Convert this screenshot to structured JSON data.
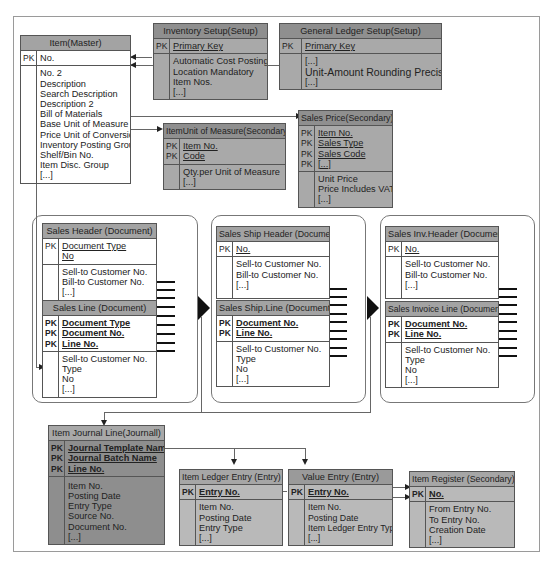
{
  "tables": {
    "item": {
      "title": "Item(Master)",
      "keys": [
        "No."
      ],
      "pk": [
        "PK"
      ],
      "fields": [
        "No. 2",
        "Description",
        "Search Description",
        "Description 2",
        "Bill of Materials",
        "Base Unit of Measure",
        "Price Unit of Conversion",
        "Inventory Posting Group",
        "Shelf/Bin No.",
        "Item Disc. Group",
        "[...]"
      ]
    },
    "inventory_setup": {
      "title": "Inventory Setup(Setup)",
      "keys": [
        "Primary Key"
      ],
      "pk": [
        "PK"
      ],
      "fields": [
        "Automatic Cost Posting",
        "Location Mandatory",
        "Item Nos.",
        "[...]"
      ]
    },
    "gl_setup": {
      "title": "General Ledger Setup(Setup)",
      "keys": [
        "Primary Key"
      ],
      "pk": [
        "PK"
      ],
      "fields": [
        "[...]",
        "Unit-Amount Rounding Precision",
        "[...]"
      ]
    },
    "item_uom": {
      "title": "ItemUnit of Measure(Secondary)",
      "keys": [
        "Item No.",
        "Code"
      ],
      "pk": [
        "PK",
        "PK"
      ],
      "fields": [
        "Qty.per Unit of Measure",
        "[...]"
      ]
    },
    "sales_price": {
      "title": "Sales Price(Secondary)",
      "keys": [
        "Item No.",
        "Sales Type",
        "Sales Code",
        "[...]"
      ],
      "pk": [
        "PK",
        "PK",
        "PK",
        "PK"
      ],
      "fields": [
        "Unit Price",
        "Price Includes VAT",
        "[...]"
      ]
    },
    "sales_header": {
      "title": "Sales Header (Document)",
      "keys": [
        "Document Type",
        "No"
      ],
      "pk": [
        "PK"
      ],
      "fields": [
        "Sell-to Customer No.",
        "Bill-to Customer No.",
        "[...]"
      ]
    },
    "sales_line": {
      "title": "Sales Line (Document)",
      "keys": [
        "Document Type",
        "Document No.",
        "Line No."
      ],
      "pk": [
        "PK",
        "PK",
        "PK"
      ],
      "fields": [
        "Sell-to Customer No.",
        "Type",
        "No",
        "[...]"
      ]
    },
    "sales_ship_header": {
      "title": "Sales Ship Header (Document)",
      "keys": [
        "No."
      ],
      "pk": [
        "PK"
      ],
      "fields": [
        "Sell-to Customer No.",
        "Bill-to Customer No.",
        "[...]"
      ]
    },
    "sales_ship_line": {
      "title": "Sales Ship.Line (Document)",
      "keys": [
        "Document No.",
        "Line No."
      ],
      "pk": [
        "PK",
        "PK"
      ],
      "fields": [
        "Sell-to Customer No.",
        "Type",
        "No",
        "[...]"
      ]
    },
    "sales_inv_header": {
      "title": "Sales Inv.Header (Document)",
      "keys": [
        "No."
      ],
      "pk": [
        "PK"
      ],
      "fields": [
        "Sell-to Customer No.",
        "Bill-to Customer No.",
        "[...]"
      ]
    },
    "sales_inv_line": {
      "title": "Sales Invoice Line (Document)",
      "keys": [
        "Document No.",
        "Line No."
      ],
      "pk": [
        "PK",
        "PK"
      ],
      "fields": [
        "Sell-to Customer No.",
        "Type",
        "No",
        "[...]"
      ]
    },
    "item_journal_line": {
      "title": "Item Journal Line(Journall)",
      "keys": [
        "Journal Template Name",
        "Journal Batch Name",
        "Line No."
      ],
      "pk": [
        "PK",
        "PK",
        "PK"
      ],
      "fields": [
        "Item No.",
        "Posting Date",
        "Entry Type",
        "Source No.",
        "Document No.",
        "[...]"
      ]
    },
    "item_ledger_entry": {
      "title": "Item Ledger Entry (Entry)",
      "keys": [
        "Entry No."
      ],
      "pk": [
        "PK"
      ],
      "fields": [
        "Item No.",
        "Posting Date",
        "Entry Type",
        "[...]"
      ]
    },
    "value_entry": {
      "title": "Value Entry (Entry)",
      "keys": [
        "Entry No."
      ],
      "pk": [
        "PK"
      ],
      "fields": [
        "Item No.",
        "Posting Date",
        "Item Ledger Entry Type",
        "[...]"
      ]
    },
    "item_register": {
      "title": "Item Register (Secondary)",
      "keys": [
        "No."
      ],
      "pk": [
        "PK"
      ],
      "fields": [
        "From Entry No.",
        "To Entry No.",
        "Creation Date",
        "[...]"
      ]
    }
  }
}
